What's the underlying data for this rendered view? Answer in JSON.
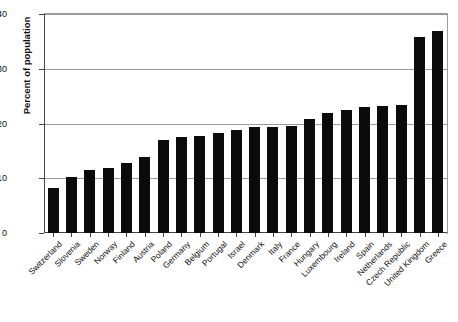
{
  "chart_data": {
    "type": "bar",
    "title": "",
    "xlabel": "",
    "ylabel": "Percent of population",
    "ylim": [
      0,
      40
    ],
    "yticks": [
      0,
      10,
      20,
      30,
      40
    ],
    "grid": true,
    "legend": "none",
    "bar_color": "#0b0b0b",
    "categories": [
      "Switzerland",
      "Slovenia",
      "Sweden",
      "Norway",
      "Finland",
      "Austria",
      "Poland",
      "Germany",
      "Belgium",
      "Portugal",
      "Israel",
      "Denmark",
      "Italy",
      "France",
      "Hungary",
      "Luxembourg",
      "Ireland",
      "Spain",
      "Netherlands",
      "Czech Republic",
      "United Kingdom",
      "Greece"
    ],
    "values": [
      8.3,
      10.2,
      11.5,
      11.8,
      12.8,
      13.8,
      17.0,
      17.5,
      17.8,
      18.3,
      18.9,
      19.3,
      19.4,
      19.6,
      20.8,
      22.0,
      22.4,
      23.0,
      23.2,
      23.4,
      35.8,
      36.9
    ]
  },
  "axis": {
    "y_tick_labels": [
      "0",
      "10",
      "20",
      "30",
      "40"
    ]
  }
}
